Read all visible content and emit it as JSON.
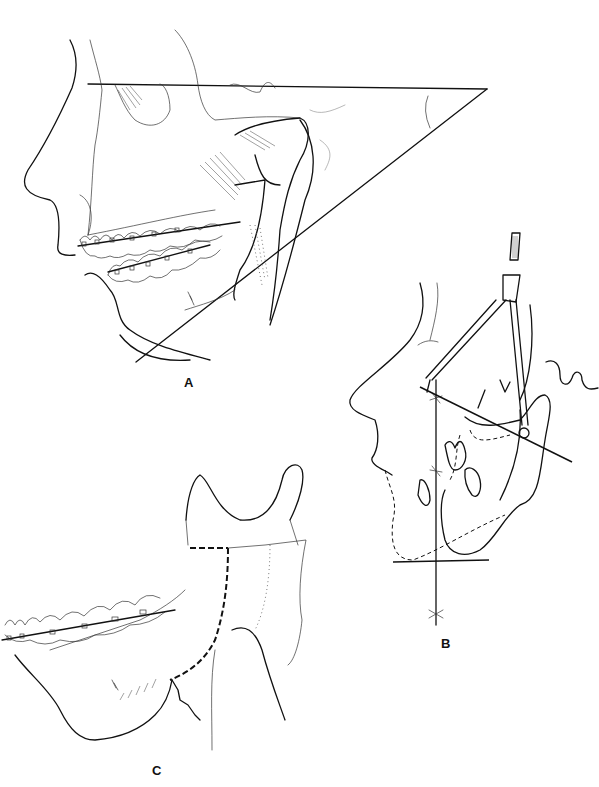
{
  "figure": {
    "panels": [
      {
        "id": "A",
        "label": "A",
        "description": "Lateral skull with orthodontic braces showing mandibular plane angle lines"
      },
      {
        "id": "B",
        "label": "B",
        "description": "Cephalometric tracing with compass measuring ramus"
      },
      {
        "id": "C",
        "label": "C",
        "description": "Mandible with ramus osteotomy cut lines"
      }
    ]
  }
}
